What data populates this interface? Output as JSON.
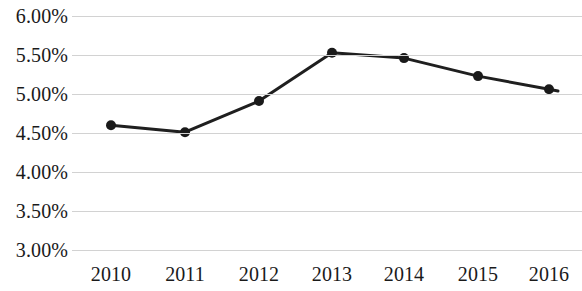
{
  "chart_data": {
    "type": "line",
    "title": "",
    "subtitle": "",
    "xlabel": "",
    "ylabel": "",
    "categories": [
      "2010",
      "2011",
      "2012",
      "2013",
      "2014",
      "2015",
      "2016"
    ],
    "values": [
      4.6,
      4.51,
      4.91,
      5.53,
      5.46,
      5.23,
      5.06
    ],
    "value_labels": [
      "4.60%",
      "4.51%",
      "4.91%",
      "5.53%",
      "5.46%",
      "5.23%",
      "5.06%"
    ],
    "series": [
      {
        "name": "",
        "values": [
          4.6,
          4.51,
          4.91,
          5.53,
          5.46,
          5.23,
          5.06
        ]
      }
    ],
    "ylim": [
      3.0,
      6.0
    ],
    "ytick_values": [
      6.0,
      5.5,
      5.0,
      4.5,
      4.0,
      3.5,
      3.0
    ],
    "ytick_labels": [
      "6.00%",
      "5.50%",
      "5.00%",
      "4.50%",
      "4.00%",
      "3.50%",
      "3.00%"
    ],
    "xtick_labels": [
      "2010",
      "2011",
      "2012",
      "2013",
      "2014",
      "2015",
      "2016"
    ],
    "grid": "horizontal",
    "legend": "none",
    "annotations": [],
    "colors": {
      "series_line": "#1f1f1f",
      "marker": "#1a1a1a",
      "gridline": "#d2d2d2",
      "text": "#1a1a1a",
      "background": "#ffffff"
    },
    "style": {
      "line_width_px": 3,
      "marker_radius_px": 5,
      "marker_shape": "circle"
    }
  }
}
